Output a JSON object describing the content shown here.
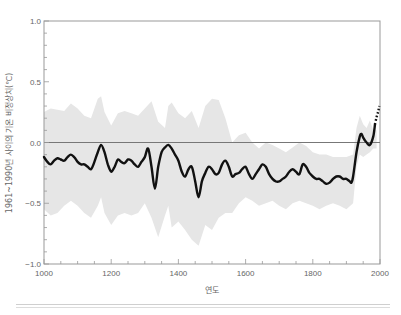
{
  "chart_data": {
    "type": "line",
    "title": "",
    "xlabel": "연도",
    "ylabel": "1961~1990년 사이의 기온 비정상치(℃)",
    "xlim": [
      1000,
      2000
    ],
    "ylim": [
      -1.0,
      1.0
    ],
    "x_ticks": [
      1000,
      1200,
      1400,
      1600,
      1800,
      2000
    ],
    "x_tick_labels": [
      "1000",
      "1200",
      "1400",
      "1600",
      "1800",
      "2000"
    ],
    "y_ticks": [
      1.0,
      0.5,
      0.0,
      -0.5,
      -1.0
    ],
    "y_tick_labels": [
      "1.0",
      "0.5",
      "0.0",
      "−0.5",
      "−1.0"
    ],
    "grid": false,
    "reference_line": 0.0,
    "colors": {
      "line": "#111111",
      "band": "#e6e6e6",
      "zero_line": "#777777",
      "axis": "#999999"
    },
    "series": [
      {
        "name": "reconstructed temperature anomaly (smoothed)",
        "style": "solid",
        "x": [
          1000,
          1010,
          1020,
          1030,
          1040,
          1050,
          1060,
          1070,
          1080,
          1090,
          1100,
          1110,
          1120,
          1130,
          1140,
          1150,
          1160,
          1170,
          1180,
          1190,
          1200,
          1210,
          1220,
          1230,
          1240,
          1250,
          1260,
          1270,
          1280,
          1290,
          1300,
          1310,
          1320,
          1330,
          1340,
          1350,
          1360,
          1370,
          1380,
          1390,
          1400,
          1410,
          1420,
          1430,
          1440,
          1450,
          1460,
          1470,
          1480,
          1490,
          1500,
          1510,
          1520,
          1530,
          1540,
          1550,
          1560,
          1570,
          1580,
          1590,
          1600,
          1610,
          1620,
          1630,
          1640,
          1650,
          1660,
          1670,
          1680,
          1690,
          1700,
          1710,
          1720,
          1730,
          1740,
          1750,
          1760,
          1770,
          1780,
          1790,
          1800,
          1810,
          1820,
          1830,
          1840,
          1850,
          1860,
          1870,
          1880,
          1890,
          1900,
          1910,
          1915,
          1920,
          1930,
          1940,
          1945,
          1950,
          1960,
          1970,
          1980,
          1985
        ],
        "values": [
          -0.12,
          -0.16,
          -0.18,
          -0.15,
          -0.13,
          -0.14,
          -0.15,
          -0.12,
          -0.1,
          -0.12,
          -0.16,
          -0.18,
          -0.18,
          -0.2,
          -0.22,
          -0.16,
          -0.08,
          -0.02,
          -0.08,
          -0.18,
          -0.24,
          -0.2,
          -0.14,
          -0.16,
          -0.17,
          -0.14,
          -0.15,
          -0.18,
          -0.2,
          -0.16,
          -0.12,
          -0.05,
          -0.2,
          -0.38,
          -0.2,
          -0.08,
          -0.04,
          -0.02,
          -0.05,
          -0.1,
          -0.15,
          -0.24,
          -0.28,
          -0.22,
          -0.2,
          -0.32,
          -0.45,
          -0.32,
          -0.25,
          -0.2,
          -0.22,
          -0.26,
          -0.25,
          -0.18,
          -0.15,
          -0.2,
          -0.28,
          -0.26,
          -0.25,
          -0.22,
          -0.2,
          -0.26,
          -0.3,
          -0.26,
          -0.22,
          -0.18,
          -0.2,
          -0.26,
          -0.3,
          -0.32,
          -0.32,
          -0.3,
          -0.28,
          -0.24,
          -0.22,
          -0.24,
          -0.26,
          -0.18,
          -0.2,
          -0.25,
          -0.28,
          -0.3,
          -0.3,
          -0.32,
          -0.34,
          -0.33,
          -0.3,
          -0.28,
          -0.28,
          -0.3,
          -0.3,
          -0.32,
          -0.33,
          -0.28,
          -0.08,
          0.05,
          0.07,
          0.04,
          0.0,
          -0.02,
          0.05,
          0.15
        ]
      },
      {
        "name": "instrumental continuation",
        "style": "dotted",
        "x": [
          1985,
          1990,
          1995,
          1998
        ],
        "values": [
          0.15,
          0.21,
          0.26,
          0.3
        ]
      },
      {
        "name": "uncertainty band upper",
        "style": "band",
        "x": [
          1000,
          1020,
          1040,
          1060,
          1080,
          1100,
          1120,
          1140,
          1160,
          1170,
          1180,
          1200,
          1220,
          1240,
          1260,
          1280,
          1300,
          1320,
          1340,
          1360,
          1370,
          1380,
          1400,
          1420,
          1440,
          1460,
          1480,
          1500,
          1520,
          1540,
          1560,
          1580,
          1600,
          1620,
          1640,
          1660,
          1680,
          1700,
          1720,
          1740,
          1760,
          1780,
          1800,
          1820,
          1840,
          1860,
          1880,
          1900,
          1920,
          1930,
          1940,
          1950,
          1960,
          1970,
          1980,
          1990
        ],
        "values": [
          0.25,
          0.28,
          0.27,
          0.26,
          0.32,
          0.28,
          0.22,
          0.2,
          0.36,
          0.38,
          0.25,
          0.14,
          0.24,
          0.26,
          0.24,
          0.22,
          0.28,
          0.34,
          0.17,
          0.12,
          0.3,
          0.33,
          0.24,
          0.2,
          0.26,
          0.12,
          0.3,
          0.36,
          0.35,
          0.2,
          0.0,
          0.06,
          0.08,
          0.0,
          -0.05,
          0.0,
          -0.02,
          -0.05,
          -0.08,
          -0.04,
          0.0,
          -0.03,
          -0.08,
          -0.1,
          -0.1,
          -0.12,
          -0.12,
          -0.12,
          -0.1,
          0.12,
          0.22,
          0.15,
          0.12,
          0.18,
          0.1,
          0.1
        ]
      },
      {
        "name": "uncertainty band lower",
        "style": "band",
        "x": [
          1000,
          1020,
          1040,
          1060,
          1080,
          1100,
          1120,
          1140,
          1160,
          1170,
          1180,
          1200,
          1220,
          1240,
          1260,
          1280,
          1300,
          1320,
          1340,
          1360,
          1370,
          1380,
          1400,
          1420,
          1440,
          1460,
          1480,
          1500,
          1520,
          1540,
          1560,
          1580,
          1600,
          1620,
          1640,
          1660,
          1680,
          1700,
          1720,
          1740,
          1760,
          1780,
          1800,
          1820,
          1840,
          1860,
          1880,
          1900,
          1920,
          1930,
          1940,
          1950,
          1960,
          1970,
          1980,
          1990
        ],
        "values": [
          -0.55,
          -0.6,
          -0.58,
          -0.52,
          -0.48,
          -0.52,
          -0.58,
          -0.62,
          -0.52,
          -0.45,
          -0.58,
          -0.68,
          -0.6,
          -0.58,
          -0.6,
          -0.58,
          -0.5,
          -0.62,
          -0.78,
          -0.6,
          -0.52,
          -0.7,
          -0.65,
          -0.72,
          -0.8,
          -0.85,
          -0.68,
          -0.72,
          -0.62,
          -0.58,
          -0.58,
          -0.5,
          -0.45,
          -0.48,
          -0.52,
          -0.5,
          -0.48,
          -0.52,
          -0.55,
          -0.5,
          -0.48,
          -0.5,
          -0.52,
          -0.55,
          -0.52,
          -0.5,
          -0.52,
          -0.55,
          -0.5,
          -0.2,
          -0.1,
          -0.12,
          -0.1,
          -0.08,
          -0.05,
          -0.05
        ]
      }
    ]
  }
}
